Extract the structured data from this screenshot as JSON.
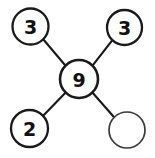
{
  "diagram": {
    "type": "node-link-star",
    "canvas": {
      "width": 155,
      "height": 158,
      "background": "#ffffff"
    },
    "colors": {
      "stroke": "#1a1a1a",
      "empty_stroke": "#3a3a3a",
      "fill": "#ffffff",
      "text": "#111111"
    },
    "nodes": [
      {
        "id": "center",
        "label": "9",
        "cx": 79,
        "cy": 79,
        "r": 19,
        "filled": true,
        "empty": false,
        "role": "center"
      },
      {
        "id": "top-left",
        "label": "3",
        "cx": 30.5,
        "cy": 26.5,
        "r": 18,
        "filled": true,
        "empty": false,
        "role": "branch"
      },
      {
        "id": "top-right",
        "label": "3",
        "cx": 124.5,
        "cy": 27.5,
        "r": 17.5,
        "filled": true,
        "empty": false,
        "role": "branch"
      },
      {
        "id": "bottom-left",
        "label": "2",
        "cx": 29.5,
        "cy": 128.5,
        "r": 18.5,
        "filled": true,
        "empty": false,
        "role": "branch"
      },
      {
        "id": "bottom-right",
        "label": "",
        "cx": 127,
        "cy": 130,
        "r": 18,
        "filled": false,
        "empty": true,
        "role": "branch-blank"
      }
    ],
    "edges": [
      {
        "id": "edge-center-top-left",
        "from": "center",
        "to": "top-left",
        "x1": 65.6,
        "y1": 65.7,
        "x2": 43.2,
        "y2": 39.3
      },
      {
        "id": "edge-center-top-right",
        "from": "center",
        "to": "top-right",
        "x1": 92.3,
        "y1": 65.9,
        "x2": 112.4,
        "y2": 40.1
      },
      {
        "id": "edge-center-bottom-left",
        "from": "center",
        "to": "bottom-left",
        "x1": 65.7,
        "y1": 92.4,
        "x2": 42.9,
        "y2": 116.1
      },
      {
        "id": "edge-center-bottom-right",
        "from": "center",
        "to": "bottom-right",
        "x1": 92.4,
        "y1": 92.5,
        "x2": 114.1,
        "y2": 117.2
      }
    ]
  }
}
